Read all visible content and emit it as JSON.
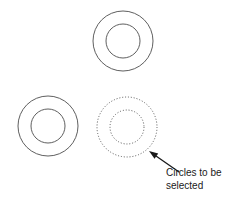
{
  "figure": {
    "type": "line-drawing",
    "background_color": "#ffffff",
    "stroke_color": "#4d4d4d",
    "dotted_stroke_color": "#555555",
    "arrow_color": "#1a1a1a",
    "text_color": "#1a1a1a"
  },
  "shapes": [
    {
      "name": "annulus-top",
      "style": "solid",
      "center_x": 123,
      "center_y": 41,
      "outer_radius": 30,
      "inner_radius": 17
    },
    {
      "name": "annulus-left",
      "style": "solid",
      "center_x": 48,
      "center_y": 126,
      "outer_radius": 30,
      "inner_radius": 17
    },
    {
      "name": "annulus-selected",
      "style": "dotted",
      "center_x": 127,
      "center_y": 127,
      "outer_radius": 30,
      "inner_radius": 17
    }
  ],
  "arrow": {
    "name": "callout-arrow",
    "tip_x": 149,
    "tip_y": 151,
    "tail_x": 179,
    "tail_y": 172
  },
  "annotation": {
    "line1": "Circles to be",
    "line2": "selected"
  }
}
